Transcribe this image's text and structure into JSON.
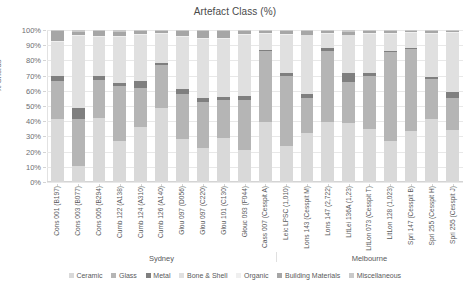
{
  "chart_data": {
    "type": "bar",
    "subtype": "stacked-percent",
    "title": "Artefact Class (%)",
    "xlabel": "",
    "ylabel": "% Sherds",
    "ylim": [
      0,
      100
    ],
    "yticks": [
      "0%",
      "10%",
      "20%",
      "30%",
      "40%",
      "50%",
      "60%",
      "70%",
      "80%",
      "90%",
      "100%"
    ],
    "grid": true,
    "legend_position": "bottom",
    "categories": [
      "Cons 001 (B197)",
      "Cons 003 (B077)",
      "Cons 005 (B294)",
      "Cumb 122 (A138)",
      "Cumb 124 (A310)",
      "Cumb 126 (A140)",
      "Glou 097 (D056)",
      "Glou 097 (C220)",
      "Glou 101 (C130)",
      "Glouc 093 (F044)",
      "Cass 007 (Cesspit A)",
      "Leic LPSC (1,010)",
      "Lons 143 (Cesspit M)",
      "Lons 147 (2,722)",
      "LitLei 136A (1,23)",
      "LitLon 073 (Cesspit T)",
      "LitLon 128 (1,023)",
      "Spri 147 (Cesspit B)",
      "Spri 255 (Cesspit H)",
      "Spri 255 (Cesspit J)"
    ],
    "groups": [
      {
        "label": "Sydney",
        "start": 0,
        "end": 10
      },
      {
        "label": "Melbourne",
        "start": 11,
        "end": 19
      }
    ],
    "series": [
      {
        "name": "Ceramic",
        "color": "#d9d9d9",
        "values": [
          41.5,
          10.5,
          42.0,
          27.0,
          36.0,
          48.5,
          28.5,
          22.5,
          29.0,
          21.0,
          39.5,
          24.0,
          32.5,
          39.5,
          39.0,
          35.0,
          27.0,
          33.5,
          41.5,
          34.0
        ]
      },
      {
        "name": "Glass",
        "color": "#b5b5b5",
        "values": [
          25.0,
          31.0,
          25.0,
          36.0,
          26.0,
          28.5,
          29.5,
          30.0,
          25.0,
          33.0,
          46.5,
          45.5,
          23.0,
          47.0,
          27.0,
          35.0,
          58.5,
          54.0,
          26.0,
          21.0
        ]
      },
      {
        "name": "Metal",
        "color": "#7f7f7f",
        "values": [
          3.5,
          7.5,
          3.0,
          2.0,
          4.5,
          1.5,
          3.5,
          3.0,
          2.0,
          2.5,
          1.0,
          2.5,
          2.5,
          1.5,
          6.0,
          1.5,
          0.8,
          1.0,
          1.5,
          4.5
        ]
      },
      {
        "name": "Bone & Shell",
        "color": "#e0e0e0",
        "values": [
          22.0,
          47.0,
          25.5,
          30.5,
          30.5,
          19.0,
          34.0,
          38.5,
          38.0,
          40.5,
          10.5,
          25.0,
          38.5,
          9.5,
          25.0,
          26.0,
          11.2,
          9.5,
          28.5,
          38.5
        ]
      },
      {
        "name": "Organic",
        "color": "#efefef",
        "values": [
          0.5,
          0.5,
          0.5,
          0.5,
          0.5,
          0.5,
          0.5,
          0.5,
          0.5,
          0.5,
          0.5,
          0.5,
          0.5,
          0.5,
          0.5,
          0.5,
          0.5,
          0.5,
          0.5,
          0.5
        ]
      },
      {
        "name": "Building Materials",
        "color": "#a6a6a6",
        "values": [
          7.0,
          2.5,
          3.5,
          3.0,
          2.0,
          1.5,
          3.5,
          5.0,
          5.0,
          2.0,
          1.5,
          2.0,
          2.5,
          1.5,
          2.0,
          1.5,
          1.5,
          1.0,
          1.5,
          1.0
        ]
      },
      {
        "name": "Miscellaneous",
        "color": "#c9c9c9",
        "values": [
          0.5,
          1.0,
          0.5,
          1.0,
          0.5,
          0.5,
          0.5,
          0.5,
          0.5,
          0.5,
          0.5,
          0.5,
          0.5,
          0.5,
          1.0,
          0.5,
          0.5,
          0.5,
          0.5,
          0.5
        ]
      }
    ]
  }
}
